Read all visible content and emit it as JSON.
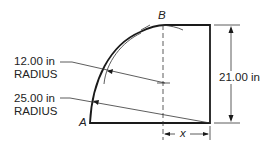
{
  "labels": {
    "point_a": "A",
    "point_b": "B",
    "radius_small_value": "12.00 in",
    "radius_small_word": "RADIUS",
    "radius_large_value": "25.00 in",
    "radius_large_word": "RADIUS",
    "height_dim": "21.00 in",
    "x_dim": "x"
  },
  "colors": {
    "line": "#1a1a1a",
    "background": "#ffffff"
  }
}
